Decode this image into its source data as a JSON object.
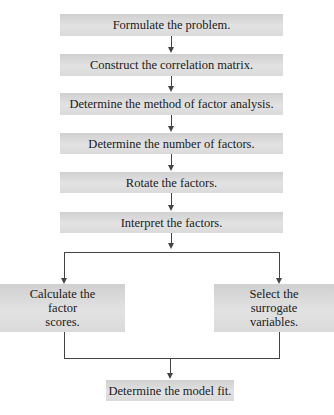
{
  "diagram": {
    "type": "flowchart",
    "title": "",
    "steps": [
      {
        "id": "formulate",
        "label": "Formulate the problem."
      },
      {
        "id": "correlation",
        "label": "Construct the correlation matrix."
      },
      {
        "id": "method",
        "label": "Determine the method of factor analysis."
      },
      {
        "id": "number",
        "label": "Determine the number of factors."
      },
      {
        "id": "rotate",
        "label": "Rotate the factors."
      },
      {
        "id": "interpret",
        "label": "Interpret the factors."
      }
    ],
    "branches": [
      {
        "id": "scores",
        "lines": [
          "Calculate the",
          "factor",
          "scores."
        ]
      },
      {
        "id": "surrogate",
        "lines": [
          "Select the",
          "surrogate",
          "variables."
        ]
      }
    ],
    "final": {
      "id": "model-fit",
      "label": "Determine the model fit."
    },
    "edges": [
      [
        "formulate",
        "correlation"
      ],
      [
        "correlation",
        "method"
      ],
      [
        "method",
        "number"
      ],
      [
        "number",
        "rotate"
      ],
      [
        "rotate",
        "interpret"
      ],
      [
        "interpret",
        "scores"
      ],
      [
        "interpret",
        "surrogate"
      ],
      [
        "scores",
        "model-fit"
      ],
      [
        "surrogate",
        "model-fit"
      ]
    ],
    "colors": {
      "box_fill": "#dcdcdc",
      "line": "#444444",
      "text": "#1a1a1a"
    }
  }
}
